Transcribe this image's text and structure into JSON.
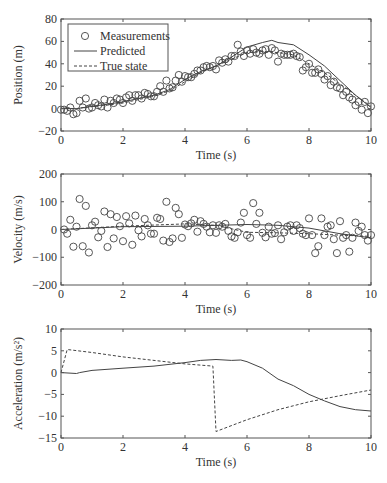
{
  "chart_data": [
    {
      "type": "scatter",
      "title": "",
      "xlabel": "Time (s)",
      "ylabel": "Position (m)",
      "xlim": [
        0,
        10
      ],
      "ylim": [
        -20,
        80
      ],
      "xticks": [
        0,
        2,
        4,
        6,
        8,
        10
      ],
      "yticks": [
        -20,
        0,
        20,
        40,
        60,
        80
      ],
      "grid": false,
      "legend": {
        "position": "upper left",
        "entries": [
          "Measurements",
          "Predicted",
          "True state"
        ]
      },
      "series": [
        {
          "name": "Measurements",
          "style": "circle",
          "x": [
            0,
            0.1,
            0.2,
            0.3,
            0.4,
            0.5,
            0.6,
            0.7,
            0.8,
            0.9,
            1.0,
            1.1,
            1.2,
            1.3,
            1.4,
            1.5,
            1.6,
            1.7,
            1.8,
            1.9,
            2.0,
            2.1,
            2.2,
            2.3,
            2.4,
            2.5,
            2.6,
            2.7,
            2.8,
            2.9,
            3.0,
            3.1,
            3.2,
            3.3,
            3.4,
            3.5,
            3.6,
            3.7,
            3.8,
            3.9,
            4.0,
            4.1,
            4.2,
            4.3,
            4.4,
            4.5,
            4.6,
            4.7,
            4.8,
            4.9,
            5.0,
            5.1,
            5.2,
            5.3,
            5.4,
            5.5,
            5.6,
            5.7,
            5.8,
            5.9,
            6.0,
            6.1,
            6.2,
            6.3,
            6.4,
            6.5,
            6.6,
            6.7,
            6.8,
            6.9,
            7.0,
            7.1,
            7.2,
            7.3,
            7.4,
            7.5,
            7.6,
            7.7,
            7.8,
            7.9,
            8.0,
            8.1,
            8.2,
            8.3,
            8.4,
            8.5,
            8.6,
            8.7,
            8.8,
            8.9,
            9.0,
            9.1,
            9.2,
            9.3,
            9.4,
            9.5,
            9.6,
            9.7,
            9.8,
            9.9,
            10.0
          ],
          "y": [
            -1,
            -1,
            -2,
            1,
            -5,
            -4,
            7,
            1,
            9,
            0,
            1,
            5,
            3,
            2,
            8,
            1,
            7,
            5,
            9,
            8,
            5,
            10,
            12,
            7,
            12,
            12,
            9,
            14,
            13,
            11,
            11,
            15,
            20,
            15,
            25,
            18,
            19,
            25,
            30,
            24,
            29,
            28,
            28,
            31,
            34,
            34,
            37,
            38,
            37,
            38,
            35,
            43,
            41,
            44,
            42,
            47,
            47,
            57,
            51,
            47,
            52,
            49,
            53,
            50,
            49,
            52,
            53,
            48,
            54,
            52,
            42,
            49,
            48,
            48,
            48,
            49,
            47,
            46,
            34,
            37,
            40,
            32,
            32,
            35,
            31,
            26,
            29,
            21,
            24,
            19,
            18,
            12,
            15,
            10,
            8,
            3,
            6,
            -1,
            6,
            -4,
            2
          ]
        },
        {
          "name": "Predicted",
          "style": "solid",
          "x": [
            0,
            0.5,
            1,
            1.5,
            2,
            2.5,
            3,
            3.5,
            4,
            4.5,
            5,
            5.5,
            6,
            6.5,
            6.8,
            7,
            7.5,
            8,
            8.5,
            9,
            9.5,
            10
          ],
          "y": [
            0,
            0,
            2,
            4,
            6,
            9,
            12,
            17,
            26,
            33,
            38,
            46,
            55,
            59,
            61,
            59,
            57,
            48,
            38,
            25,
            12,
            1
          ]
        },
        {
          "name": "True state",
          "style": "dashed",
          "x": [
            0,
            0.5,
            1,
            1.5,
            2,
            2.5,
            3,
            3.5,
            4,
            4.5,
            5,
            5.5,
            6,
            6.5,
            7,
            7.5,
            8,
            8.5,
            9,
            9.5,
            10
          ],
          "y": [
            0,
            0,
            2,
            3,
            5,
            8,
            11,
            16,
            24,
            32,
            38,
            44,
            50,
            51,
            50,
            48,
            40,
            32,
            22,
            12,
            2
          ]
        }
      ]
    },
    {
      "type": "scatter",
      "title": "",
      "xlabel": "Time (s)",
      "ylabel": "Velocity (m/s)",
      "xlim": [
        0,
        10
      ],
      "ylim": [
        -200,
        200
      ],
      "xticks": [
        0,
        2,
        4,
        6,
        8,
        10
      ],
      "yticks": [
        -200,
        -100,
        0,
        100,
        200
      ],
      "grid": false,
      "series": [
        {
          "name": "Measurements",
          "style": "circle",
          "x": [
            0.1,
            0.2,
            0.3,
            0.4,
            0.5,
            0.6,
            0.7,
            0.8,
            0.9,
            1.0,
            1.1,
            1.2,
            1.3,
            1.4,
            1.5,
            1.6,
            1.7,
            1.8,
            1.9,
            2.0,
            2.1,
            2.2,
            2.3,
            2.4,
            2.5,
            2.6,
            2.7,
            2.8,
            2.9,
            3.0,
            3.1,
            3.2,
            3.3,
            3.4,
            3.5,
            3.6,
            3.7,
            3.8,
            3.9,
            4.0,
            4.1,
            4.2,
            4.3,
            4.4,
            4.5,
            4.6,
            4.7,
            4.8,
            4.9,
            5.0,
            5.1,
            5.2,
            5.3,
            5.4,
            5.5,
            5.6,
            5.7,
            5.8,
            5.9,
            6.0,
            6.1,
            6.2,
            6.3,
            6.4,
            6.5,
            6.6,
            6.7,
            6.8,
            6.9,
            7.0,
            7.1,
            7.2,
            7.3,
            7.4,
            7.5,
            7.6,
            7.7,
            7.8,
            7.9,
            8.0,
            8.1,
            8.2,
            8.3,
            8.4,
            8.5,
            8.6,
            8.7,
            8.8,
            8.9,
            9.0,
            9.1,
            9.2,
            9.3,
            9.4,
            9.5,
            9.6,
            9.7,
            9.8,
            9.9,
            10.0
          ],
          "y": [
            0,
            -15,
            35,
            -62,
            10,
            110,
            -60,
            85,
            -83,
            15,
            28,
            -28,
            -5,
            65,
            -63,
            55,
            -32,
            45,
            12,
            -42,
            48,
            22,
            -55,
            50,
            -3,
            -25,
            38,
            15,
            -15,
            -15,
            42,
            38,
            -40,
            100,
            -45,
            -32,
            78,
            55,
            -30,
            18,
            12,
            22,
            35,
            -8,
            30,
            20,
            10,
            -10,
            15,
            -12,
            15,
            10,
            20,
            -5,
            -25,
            -30,
            -10,
            25,
            60,
            -20,
            -30,
            95,
            20,
            60,
            -12,
            -28,
            10,
            -15,
            -13,
            15,
            -35,
            -10,
            10,
            15,
            -5,
            15,
            5,
            -15,
            -20,
            40,
            -20,
            -85,
            -60,
            40,
            -20,
            10,
            15,
            -35,
            -85,
            30,
            -30,
            -20,
            -80,
            -30,
            25,
            -5,
            10,
            -20,
            -40,
            -20,
            -15,
            -55,
            -25
          ]
        },
        {
          "name": "Predicted",
          "style": "solid",
          "x": [
            0,
            2,
            4,
            6,
            7,
            8,
            9,
            10
          ],
          "y": [
            0,
            10,
            12,
            18,
            15,
            5,
            -15,
            -30
          ]
        },
        {
          "name": "True state",
          "style": "dashed",
          "x": [
            0,
            2,
            4,
            5,
            6,
            7,
            8,
            9,
            10
          ],
          "y": [
            0,
            12,
            20,
            15,
            -10,
            -12,
            -15,
            -20,
            -25
          ]
        }
      ]
    },
    {
      "type": "line",
      "title": "",
      "xlabel": "Time (s)",
      "ylabel": "Acceleration (m/s²)",
      "xlim": [
        0,
        10
      ],
      "ylim": [
        -15,
        10
      ],
      "xticks": [
        0,
        2,
        4,
        6,
        8,
        10
      ],
      "yticks": [
        -15,
        -10,
        -5,
        0,
        5,
        10
      ],
      "grid": false,
      "series": [
        {
          "name": "Predicted",
          "style": "solid",
          "x": [
            0,
            0.5,
            0.6,
            1,
            2,
            3,
            4,
            4.5,
            5,
            5.5,
            5.8,
            6,
            6.5,
            7,
            7.5,
            8,
            8.5,
            9,
            9.5,
            10
          ],
          "y": [
            0,
            -0.2,
            0,
            0.5,
            1.0,
            1.5,
            2.3,
            2.8,
            3.0,
            2.8,
            2.9,
            2.5,
            1.0,
            -1.5,
            -3.0,
            -5.0,
            -6.5,
            -7.8,
            -8.5,
            -8.8
          ]
        },
        {
          "name": "True state",
          "style": "dashed",
          "x": [
            0,
            0.2,
            1,
            2,
            3,
            4,
            4.9,
            5.0,
            6,
            7,
            8,
            9,
            10
          ],
          "y": [
            0,
            5.3,
            4.6,
            3.6,
            2.8,
            2.0,
            1.5,
            -13.5,
            -10.8,
            -8.5,
            -6.7,
            -5.3,
            -4.0
          ]
        }
      ]
    }
  ],
  "legend": {
    "entries": [
      "Measurements",
      "Predicted",
      "True state"
    ]
  },
  "axes": {
    "xlabel": "Time (s)",
    "ylabels": [
      "Position (m)",
      "Velocity (m/s)",
      "Acceleration (m/s²)"
    ]
  }
}
